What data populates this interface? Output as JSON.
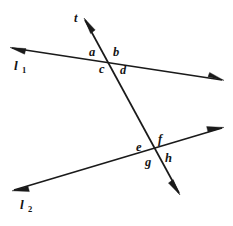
{
  "figure": {
    "background_color": "#ffffff",
    "stroke_color": "#1a1a1a",
    "width": 233,
    "height": 226
  },
  "lines": [
    {
      "id": "line-1",
      "label": "l",
      "subscript": "1",
      "label_x": 14,
      "label_y": 70,
      "sub_x": 22,
      "sub_y": 73,
      "x1": 12,
      "y1": 48,
      "x2": 222,
      "y2": 80,
      "arrow_start": true,
      "arrow_end": true
    },
    {
      "id": "line-2",
      "label": "l",
      "subscript": "2",
      "label_x": 20,
      "label_y": 209,
      "sub_x": 28,
      "sub_y": 212,
      "x1": 14,
      "y1": 190,
      "x2": 222,
      "y2": 128,
      "arrow_start": true,
      "arrow_end": true
    },
    {
      "id": "transversal-t",
      "label": "t",
      "subscript": "",
      "label_x": 74,
      "label_y": 22,
      "sub_x": 0,
      "sub_y": 0,
      "x1": 85,
      "y1": 20,
      "x2": 179,
      "y2": 193,
      "arrow_start": true,
      "arrow_end": true
    }
  ],
  "intersections": [
    {
      "id": "intersection-upper",
      "x": 110,
      "y": 57,
      "lines": "l1-and-t"
    },
    {
      "id": "intersection-lower",
      "x": 158,
      "y": 148,
      "lines": "l2-and-t"
    }
  ],
  "angle_labels": [
    {
      "id": "angle-a",
      "text": "a",
      "x": 89,
      "y": 56
    },
    {
      "id": "angle-b",
      "text": "b",
      "x": 113,
      "y": 56
    },
    {
      "id": "angle-c",
      "text": "c",
      "x": 99,
      "y": 73
    },
    {
      "id": "angle-d",
      "text": "d",
      "x": 120,
      "y": 74
    },
    {
      "id": "angle-e",
      "text": "e",
      "x": 136,
      "y": 151
    },
    {
      "id": "angle-f",
      "text": "f",
      "x": 158,
      "y": 143
    },
    {
      "id": "angle-g",
      "text": "g",
      "x": 145,
      "y": 166
    },
    {
      "id": "angle-h",
      "text": "h",
      "x": 165,
      "y": 162
    }
  ]
}
